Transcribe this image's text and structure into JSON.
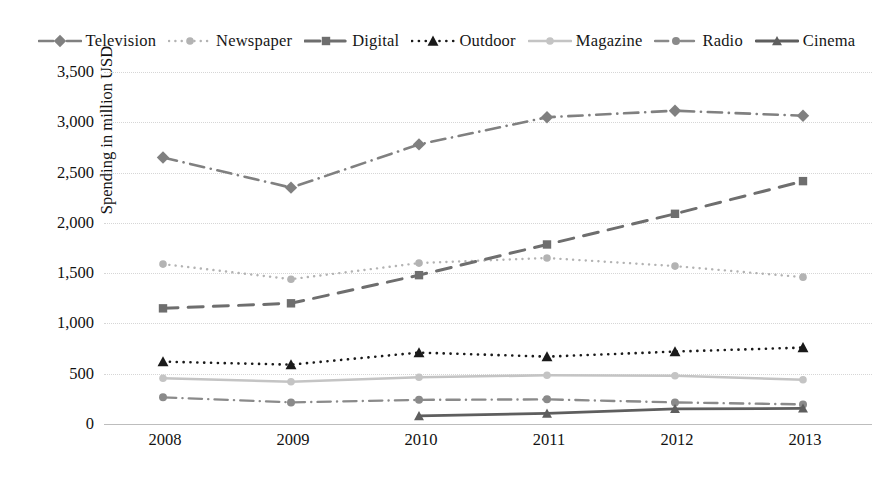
{
  "chart_data": {
    "type": "line",
    "title": "",
    "xlabel": "",
    "ylabel": "Spending in million USD",
    "categories": [
      "2008",
      "2009",
      "2010",
      "2011",
      "2012",
      "2013"
    ],
    "ylim": [
      0,
      3500
    ],
    "yticks": [
      "0",
      "500",
      "1,000",
      "1,500",
      "2,000",
      "2,500",
      "3,000",
      "3,500"
    ],
    "ytick_values": [
      0,
      500,
      1000,
      1500,
      2000,
      2500,
      3000,
      3500
    ],
    "grid": true,
    "legend_position": "top",
    "series": [
      {
        "name": "Television",
        "values": [
          2650,
          2350,
          2780,
          3050,
          3115,
          3065
        ],
        "color": "#808080",
        "marker": "diamond",
        "dash": "dashdot"
      },
      {
        "name": "Newspaper",
        "values": [
          1590,
          1440,
          1600,
          1650,
          1570,
          1460
        ],
        "color": "#b3b3b3",
        "marker": "circle",
        "dash": "dot"
      },
      {
        "name": "Digital",
        "values": [
          1150,
          1200,
          1480,
          1785,
          2090,
          2415
        ],
        "color": "#6e6e6e",
        "marker": "square",
        "dash": "dash"
      },
      {
        "name": "Outdoor",
        "values": [
          620,
          590,
          710,
          670,
          720,
          760
        ],
        "color": "#1a1a1a",
        "marker": "triangle",
        "dash": "dot"
      },
      {
        "name": "Magazine",
        "values": [
          455,
          420,
          465,
          485,
          480,
          440
        ],
        "color": "#c4c4c4",
        "marker": "circle",
        "dash": "solid"
      },
      {
        "name": "Radio",
        "values": [
          265,
          215,
          240,
          245,
          215,
          195
        ],
        "color": "#8a8a8a",
        "marker": "circle",
        "dash": "dashdot"
      },
      {
        "name": "Cinema",
        "values": [
          null,
          null,
          80,
          105,
          150,
          155
        ],
        "color": "#5e5e5e",
        "marker": "triangle",
        "dash": "solid"
      }
    ]
  }
}
